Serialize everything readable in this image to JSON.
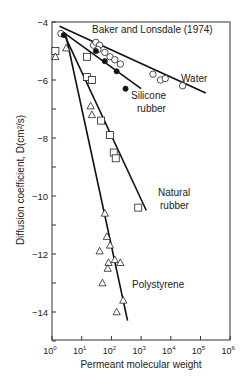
{
  "chart_data": {
    "type": "scatter",
    "title": "",
    "annotation": "Baker and Lonsdale (1974)",
    "xlabel": "Permeant molecular weight",
    "ylabel": "Diffusion coefficient, D(cm²/s)",
    "xscale": "log",
    "xlim": [
      1,
      1000000
    ],
    "ylim": [
      -15,
      -4
    ],
    "x_ticks": [
      "10^0",
      "10^1",
      "10^2",
      "10^3",
      "10^4",
      "10^5",
      "10^6"
    ],
    "y_ticks": [
      -4,
      -6,
      -8,
      -10,
      -12,
      -14
    ],
    "grid": false,
    "legend": "inline labels",
    "series": [
      {
        "name": "Water",
        "marker": "open-circle",
        "points": [
          [
            2,
            -4.4
          ],
          [
            25,
            -4.8
          ],
          [
            30,
            -4.7
          ],
          [
            40,
            -4.8
          ],
          [
            35,
            -4.95
          ],
          [
            60,
            -5.05
          ],
          [
            90,
            -5.2
          ],
          [
            130,
            -5.3
          ],
          [
            200,
            -5.45
          ],
          [
            2500,
            -5.8
          ],
          [
            4500,
            -6.0
          ],
          [
            6500,
            -5.95
          ],
          [
            25000,
            -6.2
          ]
        ],
        "fit_line": [
          [
            1.8,
            -4.15
          ],
          [
            150000,
            -6.45
          ]
        ]
      },
      {
        "name": "Silicone rubber",
        "marker": "filled-circle",
        "points": [
          [
            2.5,
            -4.45
          ],
          [
            30,
            -5.0
          ],
          [
            60,
            -5.35
          ],
          [
            150,
            -5.7
          ],
          [
            300,
            -6.3
          ]
        ],
        "fit_line": [
          [
            2,
            -4.3
          ],
          [
            1000,
            -6.3
          ]
        ]
      },
      {
        "name": "Natural rubber",
        "marker": "open-square",
        "points": [
          [
            1.3,
            -5.0
          ],
          [
            15,
            -5.2
          ],
          [
            15,
            -5.9
          ],
          [
            22,
            -6.0
          ],
          [
            45,
            -7.4
          ],
          [
            90,
            -7.9
          ],
          [
            120,
            -8.5
          ],
          [
            140,
            -8.7
          ],
          [
            800,
            -10.4
          ]
        ],
        "fit_line": [
          [
            2.5,
            -4.4
          ],
          [
            1500,
            -10.5
          ]
        ]
      },
      {
        "name": "Polystyrene",
        "marker": "open-triangle",
        "points": [
          [
            1.3,
            -5.2
          ],
          [
            3,
            -4.9
          ],
          [
            20,
            -6.9
          ],
          [
            22,
            -7.2
          ],
          [
            60,
            -10.6
          ],
          [
            40,
            -11.9
          ],
          [
            70,
            -11.4
          ],
          [
            90,
            -11.7
          ],
          [
            80,
            -12.3
          ],
          [
            75,
            -12.5
          ],
          [
            130,
            -12.2
          ],
          [
            200,
            -12.3
          ],
          [
            50,
            -13.0
          ],
          [
            250,
            -13.6
          ],
          [
            150,
            -14.0
          ]
        ],
        "fit_line": [
          [
            3,
            -4.5
          ],
          [
            350,
            -14.3
          ]
        ]
      }
    ]
  },
  "labels": {
    "annotation": "Baker and Lonsdale (1974)",
    "water": "Water",
    "silicone_1": "Silicone",
    "silicone_2": "rubber",
    "natural_1": "Natural",
    "natural_2": "rubber",
    "polystyrene": "Polystyrene",
    "xlabel": "Permeant molecular weight",
    "ylabel": "Diffusion coefficient, D(cm²/s)"
  }
}
